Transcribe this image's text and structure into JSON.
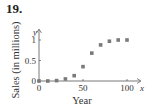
{
  "problem": {
    "number": "19."
  },
  "chart_data": {
    "type": "scatter",
    "title": "",
    "xlabel": "Year",
    "ylabel": "Sales (in millions)",
    "x_axis_symbol": "x",
    "y_axis_symbol": "y",
    "xlim": [
      0,
      105
    ],
    "ylim": [
      0,
      1.1
    ],
    "x_ticks": [
      0,
      50,
      100
    ],
    "y_ticks": [
      0,
      0.5,
      1
    ],
    "x_tick_labels": [
      "0",
      "50",
      "100"
    ],
    "y_tick_labels": [
      "0",
      "0.5",
      "1"
    ],
    "grid": false,
    "legend": null,
    "marker": "square",
    "marker_color": "#7a7a7a",
    "x": [
      0,
      10,
      20,
      30,
      40,
      50,
      60,
      70,
      80,
      90,
      100
    ],
    "y": [
      0,
      0.0,
      0.01,
      0.05,
      0.13,
      0.35,
      0.68,
      0.88,
      0.97,
      1.0,
      1.0
    ]
  }
}
